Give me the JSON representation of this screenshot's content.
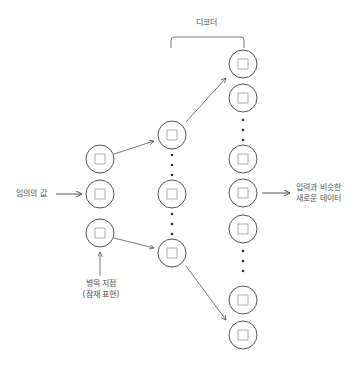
{
  "diagram": {
    "title": "디코더",
    "input_label": "임의의 값",
    "bottleneck_label_line1": "병목 지점",
    "bottleneck_label_line2": "(잠재 표현)",
    "output_label_line1": "입력과 비슷한",
    "output_label_line2": "새로운 데이터",
    "colors": {
      "stroke": "#555555",
      "inner": "#999999",
      "background": "#ffffff"
    },
    "layers": [
      {
        "name": "latent",
        "x": 100,
        "nodes": [
          159,
          194,
          233
        ],
        "dots": []
      },
      {
        "name": "hidden",
        "x": 172,
        "nodes": [
          135,
          194,
          253
        ],
        "dots": [
          [
            155,
            165,
            175
          ],
          [
            214,
            224,
            234
          ]
        ]
      },
      {
        "name": "output",
        "x": 243,
        "nodes": [
          64,
          98,
          159,
          193,
          229,
          300,
          335
        ],
        "dots": [
          [
            120,
            130,
            140
          ],
          [
            250,
            260,
            270
          ]
        ]
      }
    ]
  }
}
